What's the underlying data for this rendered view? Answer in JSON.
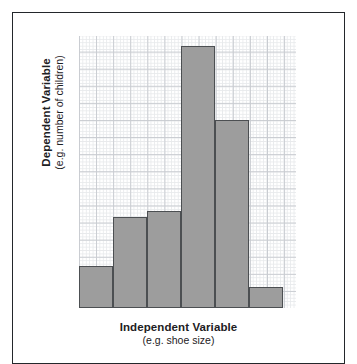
{
  "figure": {
    "frame_color": "#23272b",
    "background_color": "#ffffff"
  },
  "chart_data": {
    "type": "bar",
    "title": "",
    "subtitle": "",
    "xlabel": "Independent Variable",
    "xlabel_example": "(e.g. shoe size)",
    "ylabel": "Dependent Variable",
    "ylabel_example": "(e.g. number of children)",
    "categories": [
      "1",
      "2",
      "3",
      "4",
      "5",
      "6"
    ],
    "values": [
      42,
      91,
      97,
      262,
      188,
      21
    ],
    "ylim": [
      0,
      272
    ],
    "xlim": [
      0,
      6
    ],
    "grid": true,
    "grid_style": "graph-paper",
    "grid_minor_spacing_px": 3.42,
    "grid_major_spacing_px": 17.1,
    "legend": "none",
    "bar_fill_color": "#9d9d9d",
    "bar_stroke_color": "#4c4f52",
    "tick_labels_x": [],
    "tick_labels_y": [],
    "annotations": []
  },
  "axes": {
    "x": {
      "label_primary": "Independent Variable",
      "label_secondary": "(e.g. shoe size)"
    },
    "y": {
      "label_primary": "Dependent Variable",
      "label_secondary": "(e.g. number of children)"
    }
  }
}
